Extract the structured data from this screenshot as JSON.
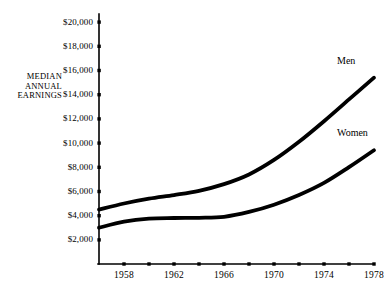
{
  "chart_data": {
    "type": "line",
    "title": "",
    "xlabel": "",
    "ylabel": "MEDIAN\nANNUAL\nEARNINGS",
    "ylabel_lines": [
      "MEDIAN",
      "ANNUAL",
      "EARNINGS"
    ],
    "xlim": [
      1956,
      1978
    ],
    "ylim": [
      0,
      20000
    ],
    "grid": false,
    "legend_position": "inline-right-of-line-end",
    "y_ticks": [
      2000,
      4000,
      6000,
      8000,
      10000,
      12000,
      14000,
      16000,
      18000,
      20000
    ],
    "y_tick_labels": [
      "$2,000",
      "$4,000",
      "$6,000",
      "$8,000",
      "$10,000",
      "$12,000",
      "$14,000",
      "$16,000",
      "$18,000",
      "$20,000"
    ],
    "x_ticks": [
      1958,
      1960,
      1962,
      1964,
      1966,
      1968,
      1970,
      1972,
      1974,
      1976,
      1978
    ],
    "x_tick_labels_shown": [
      "1958",
      "1962",
      "1966",
      "1970",
      "1974",
      "1978"
    ],
    "x_labeled_ticks": [
      1958,
      1962,
      1966,
      1970,
      1974,
      1978
    ],
    "x": [
      1956,
      1958,
      1960,
      1962,
      1964,
      1966,
      1968,
      1970,
      1972,
      1974,
      1976,
      1978
    ],
    "series": [
      {
        "name": "Men",
        "color": "#000000",
        "values": [
          4500,
          5000,
          5400,
          5700,
          6050,
          6600,
          7400,
          8600,
          10100,
          11800,
          13600,
          15400
        ]
      },
      {
        "name": "Women",
        "color": "#000000",
        "values": [
          3000,
          3500,
          3750,
          3800,
          3820,
          3900,
          4300,
          4900,
          5700,
          6700,
          8000,
          9400
        ]
      }
    ],
    "annotations": [
      {
        "text": "Men",
        "series": "Men"
      },
      {
        "text": "Women",
        "series": "Women"
      }
    ]
  },
  "colors": {
    "axis": "#000000",
    "line": "#000000",
    "background": "#ffffff"
  }
}
